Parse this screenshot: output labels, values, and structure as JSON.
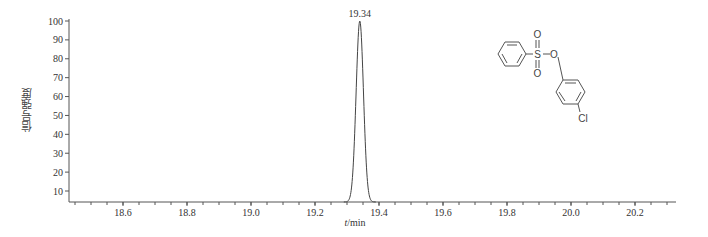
{
  "chart_data": {
    "type": "line",
    "title": "",
    "xlabel": "t/min",
    "ylabel": "信号强度",
    "xlim": [
      18.44,
      20.33
    ],
    "ylim": [
      5,
      100
    ],
    "x_ticks": [
      18.6,
      18.8,
      19.0,
      19.2,
      19.4,
      19.6,
      19.8,
      20.0,
      20.2
    ],
    "x_tick_labels": [
      "18.6",
      "18.8",
      "19.0",
      "19.2",
      "19.4",
      "19.6",
      "19.8",
      "20.0",
      "20.2"
    ],
    "y_ticks": [
      10,
      20,
      30,
      40,
      50,
      60,
      70,
      80,
      90,
      100
    ],
    "y_tick_labels": [
      "10",
      "20",
      "30",
      "40",
      "50",
      "60",
      "70",
      "80",
      "90",
      "100"
    ],
    "grid": false,
    "series": [
      {
        "name": "chromatogram",
        "x": [
          18.44,
          19.3,
          19.31,
          19.32,
          19.33,
          19.34,
          19.35,
          19.36,
          19.37,
          19.38,
          20.33
        ],
        "y": [
          5,
          5,
          22,
          60,
          92,
          100,
          92,
          60,
          22,
          5,
          5
        ]
      }
    ],
    "annotations": [
      {
        "text": "19.34",
        "x": 19.34,
        "y": 100,
        "type": "peak_label"
      }
    ],
    "structure_image": {
      "description": "4-chlorophenyl benzenesulfonate structure",
      "labels": [
        "S",
        "O",
        "O",
        "O",
        "Cl"
      ]
    }
  },
  "labels": {
    "ylabel": "信号强度",
    "xlabel_italic": "t",
    "xlabel_unit": "/min",
    "peak": "19.34",
    "mol_S": "S",
    "mol_O1": "O",
    "mol_O2": "O",
    "mol_O3": "O",
    "mol_Cl": "Cl"
  }
}
